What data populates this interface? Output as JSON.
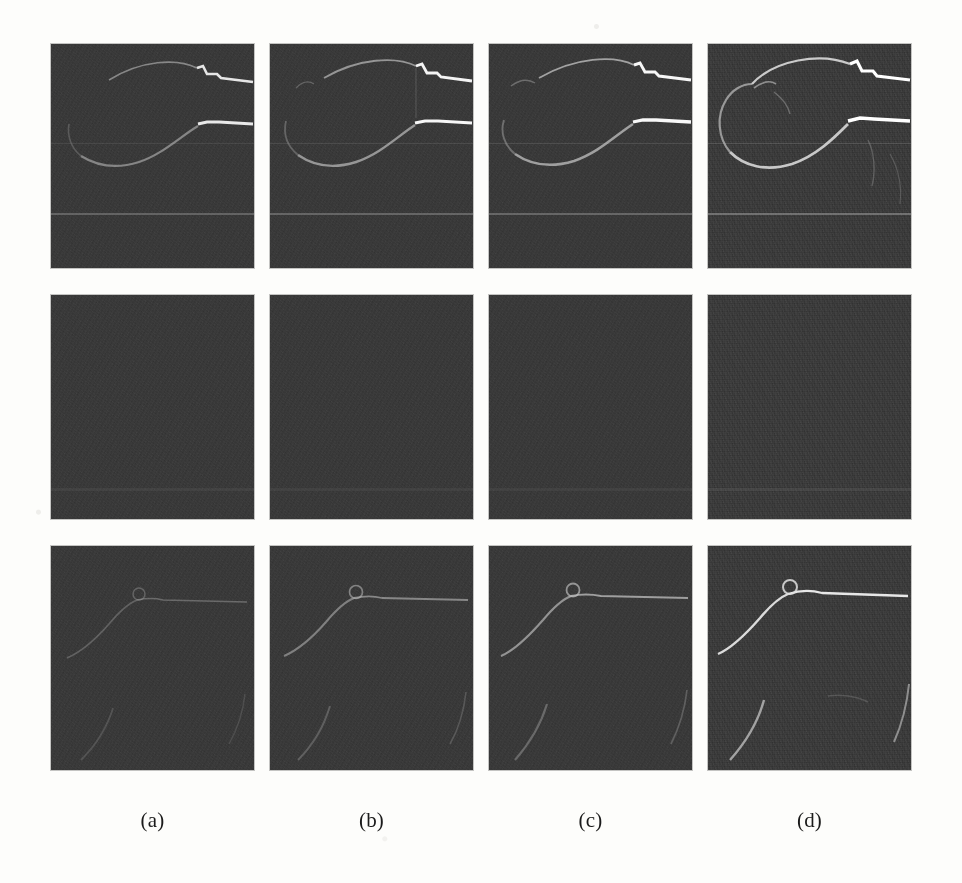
{
  "figure": {
    "kind": "image-grid",
    "rows": 3,
    "columns": 4,
    "background_color": "#fdfdfb",
    "panel_background_color": "#2b2b2b",
    "feature_color": "#f2f2f2"
  },
  "column_labels": [
    {
      "text": "(a)"
    },
    {
      "text": "(b)"
    },
    {
      "text": "(c)"
    },
    {
      "text": "(d)"
    }
  ],
  "panels": [
    {
      "id": "r1c1",
      "row": 1,
      "column": 1,
      "column_label": "(a)",
      "content": "dark speckled frame with faint upper arc, bright notched ridge at upper right, bright horizontal segment at mid right and broad lower-left arc",
      "feature_strength": "low",
      "noise_level": "medium",
      "band_y_percent": 76
    },
    {
      "id": "r1c2",
      "row": 1,
      "column": 2,
      "column_label": "(b)",
      "content": "dark speckled frame with upper arc, bright notched ridge at upper right, bright horizontal segment at mid right and broad lower-left arc",
      "feature_strength": "medium",
      "noise_level": "medium",
      "band_y_percent": 76
    },
    {
      "id": "r1c3",
      "row": 1,
      "column": 3,
      "column_label": "(c)",
      "content": "dark speckled frame with upper arc, bright notched ridge at upper right, bright horizontal segment at mid right and broad lower-left arc",
      "feature_strength": "medium-high",
      "noise_level": "medium",
      "band_y_percent": 76
    },
    {
      "id": "r1c4",
      "row": 1,
      "column": 4,
      "column_label": "(d)",
      "content": "dark speckled frame with the brightest, most continuous outline: closed upper arc, notched ridge at upper right, horizontal segment at mid right and strong lower-left arc",
      "feature_strength": "high",
      "noise_level": "high",
      "band_y_percent": 76
    },
    {
      "id": "r2c1",
      "row": 2,
      "column": 1,
      "column_label": "(a)",
      "content": "near-uniform dark speckle, no visible structure",
      "feature_strength": "none",
      "noise_level": "medium",
      "band_y_percent": 0
    },
    {
      "id": "r2c2",
      "row": 2,
      "column": 2,
      "column_label": "(b)",
      "content": "near-uniform dark speckle, no visible structure",
      "feature_strength": "none",
      "noise_level": "medium",
      "band_y_percent": 0
    },
    {
      "id": "r2c3",
      "row": 2,
      "column": 3,
      "column_label": "(c)",
      "content": "near-uniform dark speckle, no visible structure",
      "feature_strength": "none",
      "noise_level": "medium",
      "band_y_percent": 0
    },
    {
      "id": "r2c4",
      "row": 2,
      "column": 4,
      "column_label": "(d)",
      "content": "near-uniform dark speckle, very faint texture only",
      "feature_strength": "none",
      "noise_level": "high",
      "band_y_percent": 0
    },
    {
      "id": "r3c1",
      "row": 3,
      "column": 1,
      "column_label": "(a)",
      "content": "dark speckled frame with faint rising ramp that flattens into a horizontal line at upper right, a small loop at the knee, and a faint arc in the lower left",
      "feature_strength": "low",
      "noise_level": "medium",
      "band_y_percent": 0
    },
    {
      "id": "r3c2",
      "row": 3,
      "column": 2,
      "column_label": "(b)",
      "content": "dark speckled frame with rising ramp flattening into a horizontal line at upper right, small loop at the knee, faint arc in the lower left",
      "feature_strength": "medium",
      "noise_level": "medium",
      "band_y_percent": 0
    },
    {
      "id": "r3c3",
      "row": 3,
      "column": 3,
      "column_label": "(c)",
      "content": "dark speckled frame with rising ramp flattening into a horizontal line at upper right, small loop at the knee, faint arc in the lower left",
      "feature_strength": "medium-high",
      "noise_level": "medium",
      "band_y_percent": 0
    },
    {
      "id": "r3c4",
      "row": 3,
      "column": 4,
      "column_label": "(d)",
      "content": "dark speckled frame with the brightest rising ramp and horizontal line, distinct loop at the knee, and two strong arcs in the lower left and lower right",
      "feature_strength": "high",
      "noise_level": "high",
      "band_y_percent": 0
    }
  ]
}
